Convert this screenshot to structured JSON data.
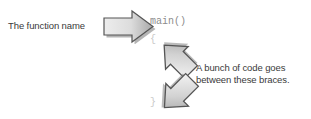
{
  "figure": {
    "type": "annotated-code-diagram",
    "background_color": "#ffffff"
  },
  "labels": {
    "function_name": "The function name",
    "braces_caption_line1": "A bunch of code goes",
    "braces_caption_line2": "between these braces."
  },
  "code": {
    "signature": "main()",
    "brace_open": "{",
    "brace_close": "}"
  },
  "arrows": [
    {
      "name": "arrow-right",
      "direction": "right",
      "points_from": "The function name",
      "points_to": "main()"
    },
    {
      "name": "arrow-up-left",
      "direction": "up-left",
      "points_from": "A bunch of code goes between these braces.",
      "points_to": "{"
    },
    {
      "name": "arrow-down-left",
      "direction": "down-left",
      "points_from": "A bunch of code goes between these braces.",
      "points_to": "}"
    }
  ],
  "colors": {
    "text": "#3a3a3a",
    "code_text": "#8c8c8c",
    "brace_text": "#c9c9c9",
    "arrow_fill_light": "#e8e8e8",
    "arrow_fill_mid": "#cfcfcf",
    "arrow_fill_dark": "#9a9a9a",
    "arrow_outline": "#555555",
    "arrow_shadow": "#6f6f6f"
  }
}
